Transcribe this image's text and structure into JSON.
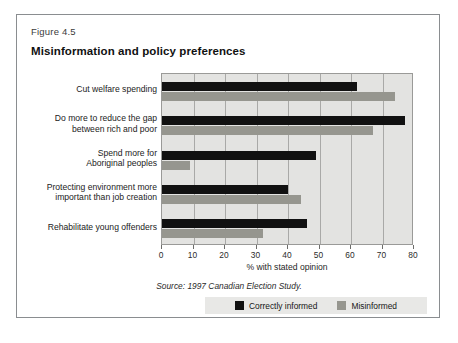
{
  "figure": {
    "number": "Figure 4.5",
    "title": "Misinformation and policy preferences",
    "source": "Source: 1997 Canadian Election Study."
  },
  "legend": {
    "items": [
      {
        "label": "Correctly informed",
        "color": "#111111",
        "swatch_name": "legend-swatch-correctly-informed"
      },
      {
        "label": "Misinformed",
        "color": "#96968f",
        "swatch_name": "legend-swatch-misinformed"
      }
    ]
  },
  "chart_data": {
    "type": "bar",
    "orientation": "horizontal",
    "title": "Misinformation and policy preferences",
    "xlabel": "% with stated opinion",
    "ylabel": "",
    "xlim": [
      0,
      80
    ],
    "xticks": [
      0,
      10,
      20,
      30,
      40,
      50,
      60,
      70,
      80
    ],
    "xtick_labels": [
      "0",
      "10",
      "20",
      "30",
      "40",
      "50",
      "60",
      "70",
      "80"
    ],
    "grid": true,
    "grid_axis": "x",
    "legend_position": "bottom-right",
    "categories": [
      "Cut welfare spending",
      "Do more to reduce the gap between rich and poor",
      "Spend more for Aboriginal peoples",
      "Protecting environment more important than job creation",
      "Rehabilitate young offenders"
    ],
    "category_lines": [
      [
        "Cut welfare spending"
      ],
      [
        "Do more to reduce the gap",
        "between rich and poor"
      ],
      [
        "Spend more for",
        "Aboriginal peoples"
      ],
      [
        "Protecting environment more",
        "important than job creation"
      ],
      [
        "Rehabilitate young offenders"
      ]
    ],
    "series": [
      {
        "name": "Correctly informed",
        "color": "#111111",
        "values": [
          62,
          77,
          49,
          40,
          46
        ]
      },
      {
        "name": "Misinformed",
        "color": "#96968f",
        "values": [
          74,
          67,
          9,
          44,
          32
        ]
      }
    ]
  }
}
